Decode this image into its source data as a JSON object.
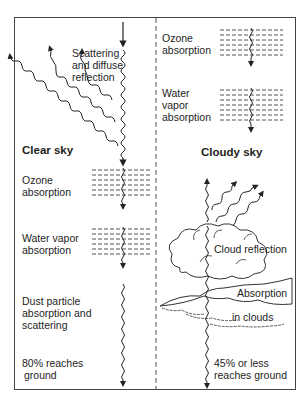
{
  "diagram": {
    "title": "",
    "panels": {
      "clear_sky": {
        "heading": "Clear sky",
        "scattering_label_1": "Scattering",
        "scattering_label_2": "and diffuse",
        "scattering_label_3": "reflection",
        "ozone_1": "Ozone",
        "ozone_2": "absorption",
        "water_1": "Water vapor",
        "water_2": "absorption",
        "dust_1": "Dust particle",
        "dust_2": "absorption and",
        "dust_3": "scattering",
        "result_1": "80% reaches",
        "result_2": "ground"
      },
      "cloudy_sky": {
        "heading": "Cloudy sky",
        "ozone_1": "Ozone",
        "ozone_2": "absorption",
        "water_1": "Water",
        "water_2": "vapor",
        "water_3": "absorption",
        "cloud_reflection": "Cloud reflection",
        "absorption_1": "Absorption",
        "absorption_2": "in clouds",
        "result_1": "45% or less",
        "result_2": "reaches ground"
      }
    },
    "colors": {
      "line": "#222222",
      "frame": "#444444",
      "dash": "#555555"
    }
  }
}
